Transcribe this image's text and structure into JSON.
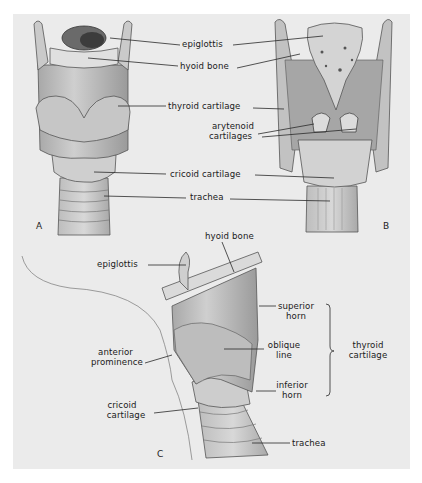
{
  "figure": {
    "background": "#ebebeb",
    "line_color": "#2a2a2a",
    "panels": {
      "A": {
        "letter": "A",
        "view": "anterior view of larynx",
        "labels": {
          "epiglottis": "epiglottis",
          "hyoid_bone": "hyoid bone",
          "thyroid_cartilage": "thyroid cartilage",
          "cricoid_cartilage": "cricoid cartilage",
          "trachea": "trachea"
        }
      },
      "B": {
        "letter": "B",
        "view": "posterior view of larynx",
        "labels": {
          "arytenoid_line1": "arytenoid",
          "arytenoid_line2": "cartilages"
        }
      },
      "C": {
        "letter": "C",
        "view": "lateral view of larynx",
        "labels": {
          "hyoid_bone": "hyoid bone",
          "epiglottis": "epiglottis",
          "superior_horn_line1": "superior",
          "superior_horn_line2": "horn",
          "oblique_line_line1": "oblique",
          "oblique_line_line2": "line",
          "thyroid_cartilage_line1": "thyroid",
          "thyroid_cartilage_line2": "cartilage",
          "anterior_prominence_line1": "anterior",
          "anterior_prominence_line2": "prominence",
          "inferior_horn_line1": "inferior",
          "inferior_horn_line2": "horn",
          "cricoid_line1": "cricoid",
          "cricoid_line2": "cartilage",
          "trachea": "trachea"
        }
      }
    }
  }
}
